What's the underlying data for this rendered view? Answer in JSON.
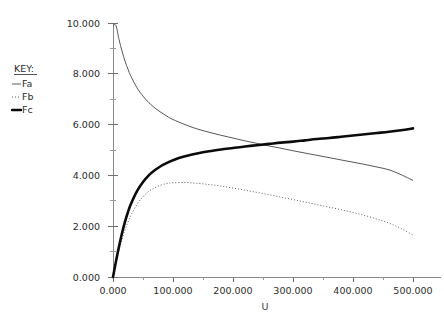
{
  "figure": {
    "width": 444,
    "height": 321,
    "background": "#ffffff"
  },
  "legend": {
    "title": "KEY:",
    "position": "top-left",
    "entries": [
      {
        "label": "Fa",
        "style": "solid-thin",
        "color": "#454545",
        "swatch": "line-icon"
      },
      {
        "label": "Fb",
        "style": "dotted",
        "color": "#4a4a4a",
        "swatch": "dotted-line-icon"
      },
      {
        "label": "Fc",
        "style": "solid-thick",
        "color": "#0b0b0b",
        "swatch": "bold-line-icon"
      }
    ]
  },
  "axes": {
    "x": {
      "label": "U",
      "min": 0,
      "max": 500,
      "major_step": 100,
      "minor_step": 50,
      "tick_labels": [
        "0.000",
        "100.000",
        "200.000",
        "300.000",
        "400.000",
        "500.000"
      ],
      "tick_values": [
        0,
        100,
        200,
        300,
        400,
        500
      ]
    },
    "y": {
      "label": "",
      "min": 0,
      "max": 10,
      "major_step": 2,
      "minor_step": 1,
      "tick_labels": [
        "0.000",
        "2.000",
        "4.000",
        "6.000",
        "8.000",
        "10.000"
      ],
      "tick_values": [
        0,
        2,
        4,
        6,
        8,
        10
      ]
    }
  },
  "chart_data": {
    "type": "line",
    "title": "",
    "xlabel": "U",
    "ylabel": "",
    "xlim": [
      0,
      500
    ],
    "ylim": [
      0,
      10
    ],
    "grid": false,
    "legend_position": "top-left",
    "x": [
      0,
      5,
      10,
      15,
      20,
      25,
      30,
      40,
      50,
      60,
      70,
      80,
      90,
      100,
      120,
      140,
      160,
      180,
      200,
      220,
      240,
      260,
      280,
      300,
      320,
      340,
      360,
      380,
      400,
      420,
      440,
      460,
      480,
      500
    ],
    "series": [
      {
        "name": "Fa",
        "style": "solid-thin",
        "color": "#454545",
        "values": [
          9.9,
          9.9,
          9.35,
          8.9,
          8.5,
          8.18,
          7.9,
          7.45,
          7.12,
          6.86,
          6.65,
          6.48,
          6.33,
          6.2,
          6.0,
          5.83,
          5.7,
          5.58,
          5.47,
          5.36,
          5.26,
          5.16,
          5.07,
          4.97,
          4.88,
          4.79,
          4.7,
          4.61,
          4.52,
          4.43,
          4.33,
          4.22,
          4.03,
          3.8
        ]
      },
      {
        "name": "Fb",
        "style": "dotted",
        "color": "#4a4a4a",
        "values": [
          0.0,
          0.55,
          1.05,
          1.48,
          1.85,
          2.17,
          2.44,
          2.86,
          3.16,
          3.38,
          3.52,
          3.62,
          3.68,
          3.71,
          3.72,
          3.69,
          3.64,
          3.58,
          3.5,
          3.42,
          3.33,
          3.24,
          3.14,
          3.05,
          2.95,
          2.85,
          2.75,
          2.65,
          2.54,
          2.42,
          2.28,
          2.12,
          1.91,
          1.65
        ]
      },
      {
        "name": "Fc",
        "style": "solid-thick",
        "color": "#0b0b0b",
        "values": [
          0.0,
          0.62,
          1.2,
          1.72,
          2.18,
          2.56,
          2.88,
          3.38,
          3.74,
          4.01,
          4.21,
          4.37,
          4.49,
          4.6,
          4.75,
          4.86,
          4.95,
          5.02,
          5.08,
          5.14,
          5.19,
          5.24,
          5.29,
          5.33,
          5.38,
          5.43,
          5.47,
          5.52,
          5.57,
          5.62,
          5.67,
          5.72,
          5.78,
          5.85
        ]
      }
    ],
    "annotations": [
      {
        "text": "Fa and Fc intersect",
        "x": 230,
        "y": 4.9
      },
      {
        "text": "Fb maximum",
        "x": 105,
        "y": 3.72
      }
    ]
  }
}
